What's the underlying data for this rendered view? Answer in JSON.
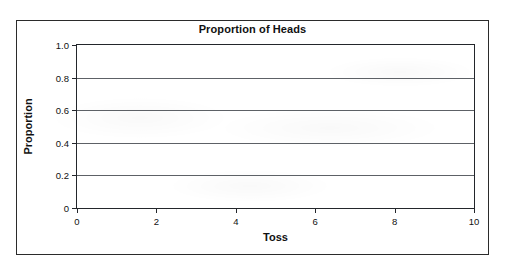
{
  "figure": {
    "background_color": "#ffffff",
    "frame_color": "#2b2b2b",
    "axis_color": "#23262b",
    "gridline_color": "#5d6166",
    "text_color": "#111111"
  },
  "chart_data": {
    "type": "line",
    "title": "Proportion of Heads",
    "xlabel": "Toss",
    "ylabel": "Proportion",
    "xlim": [
      0,
      10
    ],
    "ylim": [
      0,
      1.0
    ],
    "xticks": [
      0,
      2,
      4,
      6,
      8,
      10
    ],
    "xtick_labels": [
      "0",
      "2",
      "4",
      "6",
      "8",
      "10"
    ],
    "yticks": [
      0,
      0.2,
      0.4,
      0.6,
      0.8,
      1.0
    ],
    "ytick_labels": [
      "0",
      "0.2",
      "0.4",
      "0.6",
      "0.8",
      "1.0"
    ],
    "grid": "horizontal",
    "legend": "none",
    "series": [
      {
        "name": "Proportion of Heads",
        "x": [],
        "values": []
      }
    ],
    "annotations": [],
    "note": "Empty plotting grid — no data points are drawn."
  }
}
